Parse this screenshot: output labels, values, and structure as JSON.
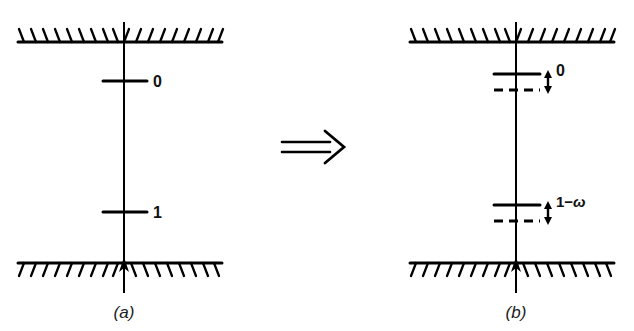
{
  "figure": {
    "type": "schematic-diagram",
    "transform_symbol": "⇒",
    "background_color": "#ffffff",
    "ink_color": "#000000",
    "panels": [
      {
        "id": "a",
        "caption": "(a)",
        "boundaries": {
          "top": {
            "name": "top-wall",
            "hatch_side": "above"
          },
          "bottom": {
            "name": "bottom-wall",
            "hatch_side": "below"
          }
        },
        "axis": {
          "name": "vertical-axis",
          "arrowhead": "up-at-bottom-wall"
        },
        "levels": [
          {
            "id": "level-0",
            "label": "0",
            "style": "solid",
            "shifted": false
          },
          {
            "id": "level-1",
            "label": "1",
            "style": "solid",
            "shifted": false
          }
        ]
      },
      {
        "id": "b",
        "caption": "(b)",
        "boundaries": {
          "top": {
            "name": "top-wall",
            "hatch_side": "above"
          },
          "bottom": {
            "name": "bottom-wall",
            "hatch_side": "below"
          }
        },
        "axis": {
          "name": "vertical-axis",
          "arrowhead": "up-at-bottom-wall"
        },
        "levels": [
          {
            "id": "level-0",
            "label": "0",
            "style": "solid-with-dashed-below",
            "shifted": true,
            "shift_arrow": "double-headed-vertical",
            "shift_label": "0"
          },
          {
            "id": "level-1",
            "label": "1-ω",
            "label_prefix": "1−",
            "label_symbol": "ω",
            "style": "solid-with-dashed-below",
            "shifted": true,
            "shift_arrow": "double-headed-vertical",
            "shift_label": "1−ω"
          }
        ]
      }
    ]
  }
}
